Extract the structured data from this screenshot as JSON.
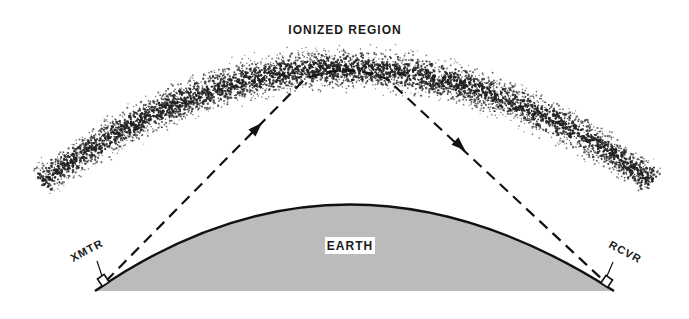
{
  "figure": {
    "type": "ionospheric-skywave-propagation",
    "labels": {
      "ionized_region": "IONIZED REGION",
      "earth": "EARTH",
      "transmitter": "XMTR",
      "receiver": "RCVR"
    },
    "colors": {
      "earth_fill": "#b8b8b8",
      "outline": "#111111",
      "stipple": "#222222",
      "background": "#ffffff"
    },
    "elements": {
      "ray_path": {
        "style": "dashed",
        "arrows": 2,
        "direction": "transmitter-to-receiver"
      }
    }
  }
}
